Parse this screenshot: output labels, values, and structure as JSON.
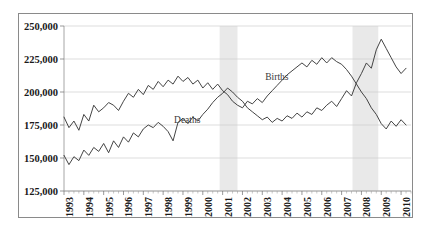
{
  "chart_data": {
    "type": "line",
    "title": "",
    "subtitle": "",
    "xlabel": "",
    "ylabel": "",
    "ylim": [
      125000,
      250000
    ],
    "yticks": [
      125000,
      150000,
      175000,
      200000,
      225000,
      250000
    ],
    "ytick_labels": [
      "125,000",
      "150,000",
      "175,000",
      "200,000",
      "225,000",
      "250,000"
    ],
    "grid": true,
    "legend_position": "inline-annotations",
    "xlim": [
      1993.0,
      2010.5
    ],
    "xtick_labels": [
      "1993",
      "1994",
      "1995",
      "1996",
      "1997",
      "1998",
      "1999",
      "2000",
      "2001",
      "2002",
      "2003",
      "2004",
      "2005",
      "2006",
      "2007",
      "2008",
      "2009",
      "2010"
    ],
    "minor_ticks_per_year": 4,
    "annotations": [
      {
        "name": "Births",
        "text": "Births",
        "x": 2003.15,
        "y": 209000
      },
      {
        "name": "Deaths",
        "text": "Deaths",
        "x": 1998.55,
        "y": 176500
      }
    ],
    "shaded_bands": [
      {
        "name": "recession-2001",
        "x_start": 2000.85,
        "x_end": 2001.75,
        "color": "#e4e4e4"
      },
      {
        "name": "recession-2008",
        "x_start": 2007.55,
        "x_end": 2008.85,
        "color": "#e4e4e4"
      }
    ],
    "series": [
      {
        "name": "Births",
        "color": "#3a3a3a",
        "x": [
          1993.0,
          1993.25,
          1993.5,
          1993.75,
          1994.0,
          1994.25,
          1994.5,
          1994.75,
          1995.0,
          1995.25,
          1995.5,
          1995.75,
          1996.0,
          1996.25,
          1996.5,
          1996.75,
          1997.0,
          1997.25,
          1997.5,
          1997.75,
          1998.0,
          1998.25,
          1998.5,
          1998.75,
          1999.0,
          1999.25,
          1999.5,
          1999.75,
          2000.0,
          2000.25,
          2000.5,
          2000.75,
          2001.0,
          2001.25,
          2001.5,
          2001.75,
          2002.0,
          2002.25,
          2002.5,
          2002.75,
          2003.0,
          2003.25,
          2003.5,
          2003.75,
          2004.0,
          2004.25,
          2004.5,
          2004.75,
          2005.0,
          2005.25,
          2005.5,
          2005.75,
          2006.0,
          2006.25,
          2006.5,
          2006.75,
          2007.0,
          2007.25,
          2007.5,
          2007.75,
          2008.0,
          2008.25,
          2008.5,
          2008.75,
          2009.0,
          2009.25,
          2009.5,
          2009.75,
          2010.0,
          2010.25
        ],
        "values": [
          181000,
          173000,
          178000,
          171000,
          183000,
          178000,
          190000,
          185000,
          188000,
          192000,
          190000,
          186000,
          193000,
          199000,
          196000,
          202000,
          198000,
          205000,
          202000,
          208000,
          204000,
          209000,
          206000,
          212000,
          208000,
          211000,
          206000,
          209000,
          203000,
          207000,
          202000,
          206000,
          201000,
          198000,
          193000,
          190000,
          188000,
          193000,
          191000,
          195000,
          192000,
          197000,
          201000,
          205000,
          209000,
          213000,
          216000,
          219000,
          222000,
          219000,
          224000,
          221000,
          226000,
          222000,
          226000,
          223000,
          221000,
          217000,
          212000,
          206000,
          200000,
          195000,
          188000,
          183000,
          176000,
          172000,
          178000,
          174000,
          179000,
          175000
        ]
      },
      {
        "name": "Deaths",
        "color": "#3a3a3a",
        "x": [
          1993.0,
          1993.25,
          1993.5,
          1993.75,
          1994.0,
          1994.25,
          1994.5,
          1994.75,
          1995.0,
          1995.25,
          1995.5,
          1995.75,
          1996.0,
          1996.25,
          1996.5,
          1996.75,
          1997.0,
          1997.25,
          1997.5,
          1997.75,
          1998.0,
          1998.25,
          1998.5,
          1998.75,
          1999.0,
          1999.25,
          1999.5,
          1999.75,
          2000.0,
          2000.25,
          2000.5,
          2000.75,
          2001.0,
          2001.25,
          2001.5,
          2001.75,
          2002.0,
          2002.25,
          2002.5,
          2002.75,
          2003.0,
          2003.25,
          2003.5,
          2003.75,
          2004.0,
          2004.25,
          2004.5,
          2004.75,
          2005.0,
          2005.25,
          2005.5,
          2005.75,
          2006.0,
          2006.25,
          2006.5,
          2006.75,
          2007.0,
          2007.25,
          2007.5,
          2007.75,
          2008.0,
          2008.25,
          2008.5,
          2008.75,
          2009.0,
          2009.25,
          2009.5,
          2009.75,
          2010.0,
          2010.25
        ],
        "values": [
          152000,
          145000,
          151000,
          148000,
          156000,
          152000,
          158000,
          155000,
          161000,
          154000,
          163000,
          158000,
          166000,
          162000,
          169000,
          166000,
          172000,
          175000,
          173000,
          177000,
          174000,
          170000,
          163000,
          177000,
          180000,
          176000,
          181000,
          178000,
          183000,
          187000,
          192000,
          196000,
          199000,
          203000,
          200000,
          196000,
          193000,
          188000,
          185000,
          182000,
          179000,
          181000,
          177000,
          180000,
          178000,
          182000,
          180000,
          184000,
          181000,
          185000,
          183000,
          188000,
          186000,
          190000,
          193000,
          189000,
          195000,
          201000,
          197000,
          207000,
          214000,
          222000,
          218000,
          232000,
          240000,
          233000,
          226000,
          219000,
          214000,
          218000
        ]
      }
    ]
  }
}
